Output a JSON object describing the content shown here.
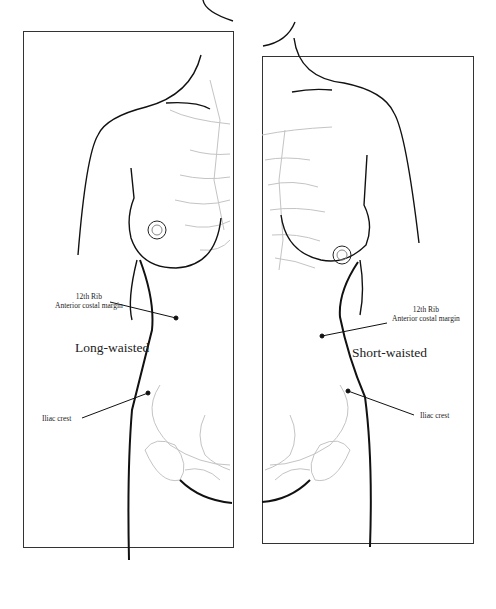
{
  "figure": {
    "left_panel": {
      "title": "Long-waisted",
      "labels": {
        "rib_line1": "12th Rib",
        "rib_line2": "Anterior costal margin",
        "iliac": "Iliac crest"
      }
    },
    "right_panel": {
      "title": "Short-waisted",
      "labels": {
        "rib_line1": "12th Rib",
        "rib_line2": "Anterior costal margin",
        "iliac": "Iliac crest"
      }
    },
    "colors": {
      "line": "#111111",
      "frame": "#333333",
      "bone_sketch": "#bbbbbb"
    }
  }
}
